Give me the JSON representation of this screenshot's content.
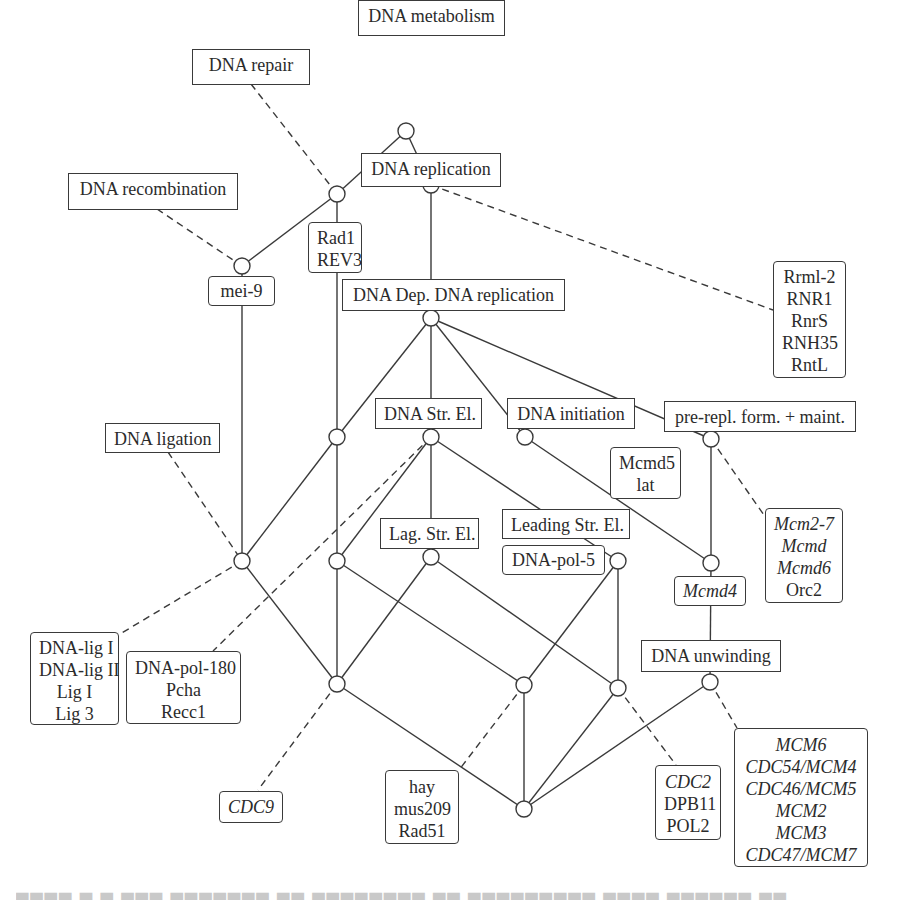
{
  "diagram": {
    "type": "concept-lattice",
    "attribute_labels": [
      {
        "id": "metabolism",
        "text": "DNA metabolism"
      },
      {
        "id": "repair",
        "text": "DNA repair"
      },
      {
        "id": "replication",
        "text": "DNA replication"
      },
      {
        "id": "recombination",
        "text": "DNA recombination"
      },
      {
        "id": "dep_replication",
        "text": "DNA Dep. DNA replication"
      },
      {
        "id": "str_el",
        "text": "DNA Str. El."
      },
      {
        "id": "initiation",
        "text": "DNA initiation"
      },
      {
        "id": "prerepl",
        "text": "pre-repl. form. + maint."
      },
      {
        "id": "ligation",
        "text": "DNA ligation"
      },
      {
        "id": "lag",
        "text": "Lag. Str. El."
      },
      {
        "id": "leading",
        "text": "Leading Str. El."
      },
      {
        "id": "unwinding",
        "text": "DNA unwinding"
      }
    ],
    "object_labels": {
      "rad1": [
        "Rad1",
        "REV3"
      ],
      "rrml": [
        "Rrml-2",
        "RNR1",
        "RnrS",
        "RNH35",
        "RntL"
      ],
      "mei9": [
        "mei-9"
      ],
      "mcmd5": [
        "Mcmd5",
        "lat"
      ],
      "mcm27": [
        "Mcm2-7",
        "Mcmd",
        "Mcmd6",
        "Orc2"
      ],
      "mcm27_italic": [
        true,
        true,
        true,
        false
      ],
      "pol5": [
        "DNA-pol-5"
      ],
      "mcmd4": [
        "Mcmd4"
      ],
      "lig": [
        "DNA-lig I",
        "DNA-lig II",
        "Lig I",
        "Lig 3"
      ],
      "pol180": [
        "DNA-pol-180",
        "Pcha",
        "Recc1"
      ],
      "cdc9": [
        "CDC9"
      ],
      "hay": [
        "hay",
        "mus209",
        "Rad51"
      ],
      "cdc2": [
        "CDC2",
        "DPB11",
        "POL2"
      ],
      "cdc2_italic": [
        true,
        false,
        false
      ],
      "mcm6": [
        "MCM6",
        "CDC54/MCM4",
        "CDC46/MCM5",
        "MCM2",
        "MCM3",
        "CDC47/MCM7"
      ]
    },
    "colors": {
      "line": "#3a3a3a",
      "box_border": "#3a3a3a",
      "text": "#2b2b2b",
      "background": "#ffffff"
    },
    "caption_visible": "(caption text clipped at bottom edge, unreadable)"
  }
}
